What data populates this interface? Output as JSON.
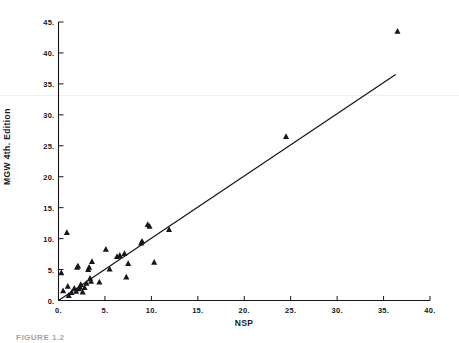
{
  "figure": {
    "caption": "FIGURE 1.2",
    "background_color": "#ffffff",
    "ink_color": "#16161a"
  },
  "chart_data": {
    "type": "scatter",
    "title": "",
    "xlabel": "NSP",
    "ylabel": "MGW 4th. Edition",
    "xlim": [
      0,
      40
    ],
    "ylim": [
      0,
      45
    ],
    "grid": false,
    "legend": null,
    "marker": "triangle",
    "marker_color": "#16161a",
    "xticks": [
      0,
      5,
      10,
      15,
      20,
      25,
      30,
      35,
      40
    ],
    "xtick_labels": [
      "0.",
      "5.",
      "10.",
      "15.",
      "20.",
      "25.",
      "30.",
      "35.",
      "40."
    ],
    "yticks": [
      0,
      5,
      10,
      15,
      20,
      25,
      30,
      35,
      40,
      45
    ],
    "ytick_labels": [
      "0.",
      "5.",
      "10.",
      "15.",
      "20.",
      "25.",
      "30.",
      "35.",
      "40.",
      "45."
    ],
    "points": [
      [
        0.3,
        4.5
      ],
      [
        0.5,
        1.6
      ],
      [
        0.9,
        11.0
      ],
      [
        1.0,
        2.3
      ],
      [
        1.1,
        0.8
      ],
      [
        1.4,
        1.3
      ],
      [
        1.7,
        2.0
      ],
      [
        1.9,
        1.5
      ],
      [
        2.0,
        5.4
      ],
      [
        2.1,
        5.6
      ],
      [
        2.2,
        1.9
      ],
      [
        2.3,
        2.2
      ],
      [
        2.4,
        2.6
      ],
      [
        2.6,
        1.4
      ],
      [
        2.8,
        2.1
      ],
      [
        3.0,
        2.8
      ],
      [
        3.2,
        5.0
      ],
      [
        3.3,
        5.4
      ],
      [
        3.4,
        3.6
      ],
      [
        3.5,
        3.1
      ],
      [
        3.6,
        6.3
      ],
      [
        4.4,
        3.0
      ],
      [
        5.1,
        8.3
      ],
      [
        5.5,
        5.1
      ],
      [
        6.3,
        7.1
      ],
      [
        6.6,
        7.3
      ],
      [
        7.1,
        7.6
      ],
      [
        7.3,
        3.8
      ],
      [
        7.5,
        6.0
      ],
      [
        8.9,
        9.3
      ],
      [
        9.0,
        9.6
      ],
      [
        9.6,
        12.3
      ],
      [
        9.8,
        12.0
      ],
      [
        10.3,
        6.2
      ],
      [
        11.9,
        11.5
      ],
      [
        24.5,
        26.5
      ],
      [
        36.5,
        43.5
      ]
    ],
    "fit_line": {
      "type": "line",
      "label": "regression line",
      "x": [
        0,
        36.3
      ],
      "y": [
        0,
        36.5
      ],
      "slope": 1.0,
      "intercept": 0
    }
  }
}
